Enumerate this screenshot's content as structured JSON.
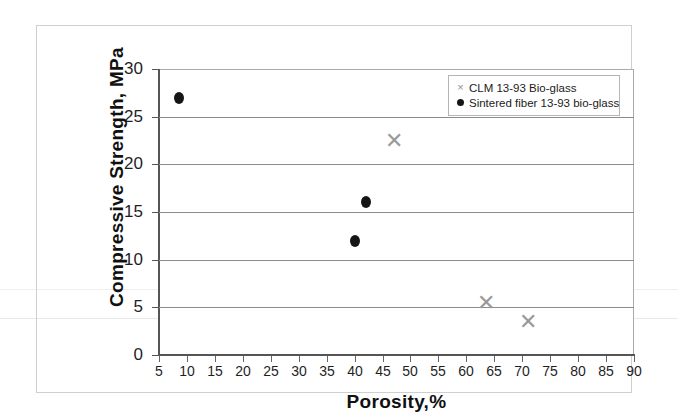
{
  "chart_data": {
    "type": "scatter",
    "title": "",
    "xlabel": "Porosity,%",
    "ylabel": "Compressive Strength, MPa",
    "xlim": [
      5,
      90
    ],
    "ylim": [
      0,
      30
    ],
    "xticks": [
      5,
      10,
      15,
      20,
      25,
      30,
      35,
      40,
      45,
      50,
      55,
      60,
      65,
      70,
      75,
      80,
      85,
      90
    ],
    "yticks": [
      0,
      5,
      10,
      15,
      20,
      25,
      30
    ],
    "grid": "horizontal",
    "legend_position": "top-right",
    "series": [
      {
        "name": "CLM 13-93 Bio-glass",
        "marker": "cross",
        "color": "#9a9a9a",
        "points": [
          {
            "x": 47,
            "y": 22.5
          },
          {
            "x": 63.5,
            "y": 5.5
          },
          {
            "x": 71,
            "y": 3.5
          }
        ]
      },
      {
        "name": "Sintered fiber 13-93 bio-glass",
        "marker": "dot",
        "color": "#151515",
        "points": [
          {
            "x": 8.5,
            "y": 27
          },
          {
            "x": 42,
            "y": 16
          },
          {
            "x": 40,
            "y": 12
          }
        ]
      }
    ]
  },
  "axes": {
    "y_tick_labels": [
      "30",
      "25",
      "20",
      "15",
      "10",
      "5",
      "0"
    ],
    "x_tick_labels": [
      "5",
      "10",
      "15",
      "20",
      "25",
      "30",
      "35",
      "40",
      "45",
      "50",
      "55",
      "60",
      "65",
      "70",
      "75",
      "80",
      "85",
      "90"
    ],
    "y_title": "Compressive Strength, MPa",
    "x_title": "Porosity,%"
  },
  "legend": {
    "entries": [
      {
        "marker": "cross-marker-icon",
        "label": "CLM 13-93 Bio-glass"
      },
      {
        "marker": "dot-marker-icon",
        "label": "Sintered fiber 13-93 bio-glass"
      }
    ]
  }
}
